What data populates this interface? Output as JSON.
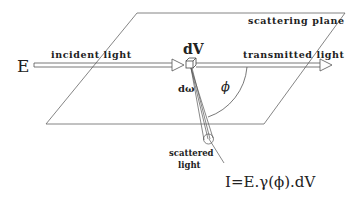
{
  "diagram": {
    "labels": {
      "field": "E",
      "incident": "incident light",
      "volume": "dV",
      "transmitted": "transmitted light",
      "plane": "scattering plane",
      "solid_angle": "dω",
      "angle": "ϕ",
      "scattered_line1": "scattered",
      "scattered_line2": "light",
      "equation": "I=E.γ(ϕ).dV"
    },
    "colors": {
      "line": "#555555",
      "text": "#222222",
      "background": "#ffffff"
    }
  }
}
